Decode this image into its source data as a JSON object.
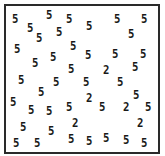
{
  "stimulus": {
    "type": "visual-search-array",
    "target_char": "2",
    "distractor_char": "5",
    "border_color": "#2a2a2a",
    "glyph_color": "#1a1a1a",
    "glyphs": [
      {
        "char": "5",
        "x": 12,
        "y": 12
      },
      {
        "char": "5",
        "x": 27,
        "y": 21
      },
      {
        "char": "5",
        "x": 46,
        "y": 8
      },
      {
        "char": "5",
        "x": 66,
        "y": 12
      },
      {
        "char": "5",
        "x": 36,
        "y": 31
      },
      {
        "char": "5",
        "x": 56,
        "y": 25
      },
      {
        "char": "5",
        "x": 86,
        "y": 19
      },
      {
        "char": "5",
        "x": 114,
        "y": 12
      },
      {
        "char": "5",
        "x": 141,
        "y": 12
      },
      {
        "char": "5",
        "x": 128,
        "y": 27
      },
      {
        "char": "5",
        "x": 14,
        "y": 42
      },
      {
        "char": "5",
        "x": 70,
        "y": 39
      },
      {
        "char": "5",
        "x": 85,
        "y": 48
      },
      {
        "char": "5",
        "x": 112,
        "y": 47
      },
      {
        "char": "5",
        "x": 140,
        "y": 47
      },
      {
        "char": "5",
        "x": 32,
        "y": 56
      },
      {
        "char": "5",
        "x": 50,
        "y": 50
      },
      {
        "char": "5",
        "x": 68,
        "y": 62
      },
      {
        "char": "2",
        "x": 103,
        "y": 63
      },
      {
        "char": "5",
        "x": 132,
        "y": 60
      },
      {
        "char": "5",
        "x": 18,
        "y": 73
      },
      {
        "char": "5",
        "x": 53,
        "y": 75
      },
      {
        "char": "5",
        "x": 83,
        "y": 75
      },
      {
        "char": "5",
        "x": 117,
        "y": 75
      },
      {
        "char": "5",
        "x": 38,
        "y": 85
      },
      {
        "char": "5",
        "x": 10,
        "y": 95
      },
      {
        "char": "5",
        "x": 28,
        "y": 103
      },
      {
        "char": "5",
        "x": 46,
        "y": 104
      },
      {
        "char": "5",
        "x": 66,
        "y": 100
      },
      {
        "char": "2",
        "x": 86,
        "y": 91
      },
      {
        "char": "5",
        "x": 99,
        "y": 100
      },
      {
        "char": "2",
        "x": 123,
        "y": 100
      },
      {
        "char": "5",
        "x": 133,
        "y": 88
      },
      {
        "char": "5",
        "x": 145,
        "y": 100
      },
      {
        "char": "5",
        "x": 20,
        "y": 120
      },
      {
        "char": "5",
        "x": 48,
        "y": 124
      },
      {
        "char": "2",
        "x": 72,
        "y": 116
      },
      {
        "char": "2",
        "x": 137,
        "y": 116
      },
      {
        "char": "5",
        "x": 13,
        "y": 136
      },
      {
        "char": "5",
        "x": 34,
        "y": 136
      },
      {
        "char": "5",
        "x": 68,
        "y": 132
      },
      {
        "char": "5",
        "x": 86,
        "y": 134
      },
      {
        "char": "5",
        "x": 103,
        "y": 131
      },
      {
        "char": "5",
        "x": 123,
        "y": 133
      },
      {
        "char": "5",
        "x": 141,
        "y": 136
      }
    ]
  }
}
